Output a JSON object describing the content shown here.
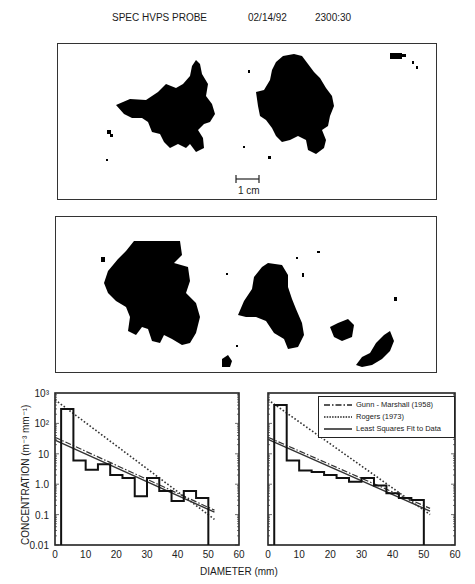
{
  "header": {
    "instrument": "SPEC HVPS PROBE",
    "date": "02/14/92",
    "time": "2300:30"
  },
  "images": [
    {
      "name": "top-image-panel",
      "scale_bar_label": "1 cm"
    },
    {
      "name": "bottom-image-panel"
    }
  ],
  "axis": {
    "ylabel": "CONCENTRATION (m⁻³ mm⁻¹)",
    "xlabel": "DIAMETER (mm)"
  },
  "legend": {
    "items": [
      {
        "label": "Gunn - Marshall (1958)",
        "style": "dash-dot"
      },
      {
        "label": "Rogers (1973)",
        "style": "dotted"
      },
      {
        "label": "Least Squares Fit to Data",
        "style": "solid"
      }
    ]
  },
  "chart_data": [
    {
      "type": "line",
      "title": "",
      "xlabel": "DIAMETER (mm)",
      "ylabel": "CONCENTRATION (m^-3 mm^-1)",
      "xlim": [
        0,
        60
      ],
      "ylim": [
        0.01,
        1000
      ],
      "yscale": "log",
      "xticks": [
        "0",
        "10",
        "20",
        "30",
        "40",
        "50",
        "60"
      ],
      "yticks": [
        "0.01",
        "0.1",
        "1.0",
        "10",
        "10²",
        "10³"
      ],
      "histogram": {
        "bin_edges": [
          2,
          6,
          10,
          14,
          18,
          22,
          26,
          30,
          34,
          38,
          42,
          46,
          50
        ],
        "values": [
          300,
          6,
          3,
          4.5,
          2,
          1.6,
          0.4,
          1.6,
          0.6,
          0.28,
          0.6,
          0.35
        ]
      },
      "series": [
        {
          "name": "Gunn-Marshall (1958)",
          "x": [
            0,
            52
          ],
          "y": [
            35,
            0.14
          ]
        },
        {
          "name": "Rogers (1973)",
          "x": [
            0,
            52
          ],
          "y": [
            600,
            0.07
          ]
        },
        {
          "name": "Least Squares Fit to Data",
          "x": [
            0,
            52
          ],
          "y": [
            28,
            0.12
          ]
        }
      ],
      "grid": false
    },
    {
      "type": "line",
      "title": "",
      "xlabel": "DIAMETER (mm)",
      "ylabel": "",
      "xlim": [
        0,
        60
      ],
      "ylim": [
        0.01,
        1000
      ],
      "yscale": "log",
      "xticks": [
        "0",
        "10",
        "20",
        "30",
        "40",
        "50",
        "60"
      ],
      "histogram": {
        "bin_edges": [
          2,
          6,
          10,
          14,
          18,
          22,
          26,
          30,
          34,
          38,
          42,
          46,
          50
        ],
        "values": [
          400,
          6,
          2.8,
          2.5,
          2,
          1.6,
          1.2,
          1.6,
          0.9,
          0.5,
          0.35,
          0.3
        ]
      },
      "series": [
        {
          "name": "Gunn-Marshall (1958)",
          "x": [
            0,
            52
          ],
          "y": [
            35,
            0.16
          ]
        },
        {
          "name": "Rogers (1973)",
          "x": [
            0,
            52
          ],
          "y": [
            600,
            0.1
          ]
        },
        {
          "name": "Least Squares Fit to Data",
          "x": [
            0,
            52
          ],
          "y": [
            30,
            0.13
          ]
        }
      ],
      "legend_position": "upper right",
      "grid": false
    }
  ]
}
